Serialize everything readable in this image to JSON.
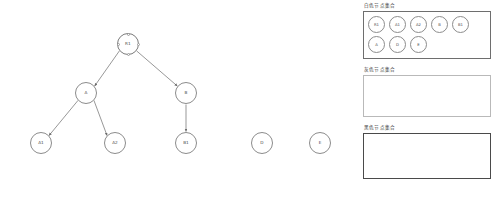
{
  "canvas": {
    "name": "graph-canvas",
    "background": "#ffffff",
    "node_stroke": "#8c8c8c",
    "node_fill": "#ffffff",
    "edge_color": "#6b6b6b",
    "nodes": [
      {
        "id": "R1",
        "label": "R1",
        "x": 128,
        "y": 44,
        "selected": true
      },
      {
        "id": "A",
        "label": "A",
        "x": 86,
        "y": 93,
        "selected": false
      },
      {
        "id": "B",
        "label": "B",
        "x": 186,
        "y": 93,
        "selected": false
      },
      {
        "id": "A1",
        "label": "A1",
        "x": 41,
        "y": 143,
        "selected": false
      },
      {
        "id": "A2",
        "label": "A2",
        "x": 115,
        "y": 143,
        "selected": false
      },
      {
        "id": "B1",
        "label": "B1",
        "x": 186,
        "y": 143,
        "selected": false
      },
      {
        "id": "D",
        "label": "D",
        "x": 262,
        "y": 143,
        "selected": false
      },
      {
        "id": "E",
        "label": "E",
        "x": 320,
        "y": 143,
        "selected": false
      }
    ],
    "edges": [
      {
        "from": "R1",
        "to": "A",
        "directed": true
      },
      {
        "from": "R1",
        "to": "B",
        "directed": true
      },
      {
        "from": "A",
        "to": "A1",
        "directed": true
      },
      {
        "from": "A",
        "to": "A2",
        "directed": true
      },
      {
        "from": "B",
        "to": "B1",
        "directed": true
      }
    ]
  },
  "panel": {
    "sets": [
      {
        "key": "white",
        "title": "白色节点集合",
        "border_color": "#6e6e6e",
        "members": [
          "R1",
          "A1",
          "A2",
          "B",
          "B1",
          "A",
          "D",
          "E"
        ]
      },
      {
        "key": "gray",
        "title": "灰色节点集合",
        "border_color": "#b9b9b9",
        "members": []
      },
      {
        "key": "black",
        "title": "黑色节点集合",
        "border_color": "#4a4a4a",
        "members": []
      }
    ]
  }
}
